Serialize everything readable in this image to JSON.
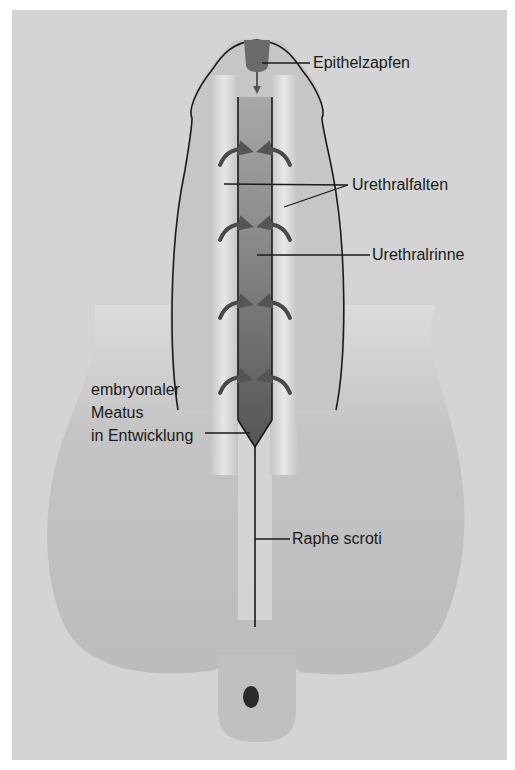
{
  "figure": {
    "type": "anatomical-diagram",
    "colors": {
      "background": "#d4d4d4",
      "scrotum": "#bdbdbd",
      "shaft": "#c4c4c4",
      "fold_highlight": "#e6e6e6",
      "groove": "#7a7a7a",
      "groove_dark": "#555555",
      "epithelial_plug": "#6a6a6a",
      "perineum_dot": "#2a2a2a",
      "outline": "#1a1a1a"
    }
  },
  "labels": {
    "epithelzapfen": "Epithelzapfen",
    "urethralfalten": "Urethralfalten",
    "urethralrinne": "Urethralrinne",
    "meatus": "embryonaler\nMeatus\nin Entwicklung",
    "raphe": "Raphe scroti"
  }
}
